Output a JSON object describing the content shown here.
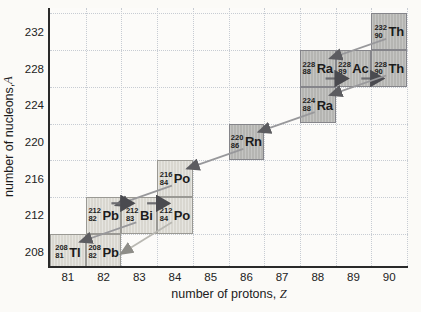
{
  "axes": {
    "x": {
      "title": "number of protons, ",
      "variable": "Z"
    },
    "y": {
      "title": "number of nucleons, ",
      "variable": "A"
    }
  },
  "colors": {
    "box_dark": "#b5b5b2",
    "box_dark_border": "#85858a",
    "box_light": "#d9d7d0",
    "box_light_border": "#9a9994",
    "alpha_line": "#98989b",
    "alpha_head": "#5c5c60",
    "beta_line": "#6d6d71",
    "beta_head": "#4a4a4f",
    "light_line": "#b9b8b2",
    "light_head": "#8e8d88",
    "axis": "#2a2a2a",
    "grid": "#c7ccd3",
    "text": "#1c1c1c"
  },
  "chart_data": {
    "type": "scatter",
    "title": "",
    "xlabel": "number of protons, Z",
    "ylabel": "number of nucleons, A",
    "xlim": [
      80.5,
      90.5
    ],
    "ylim": [
      206,
      234
    ],
    "x_ticks": [
      81,
      82,
      83,
      84,
      85,
      86,
      87,
      88,
      89,
      90
    ],
    "y_ticks": [
      232,
      228,
      224,
      220,
      216,
      212,
      208
    ],
    "grid": true,
    "nuclides": [
      {
        "id": "th232",
        "symbol": "Th",
        "mass": 232,
        "protons": 90,
        "shade": "dark"
      },
      {
        "id": "ra228",
        "symbol": "Ra",
        "mass": 228,
        "protons": 88,
        "shade": "dark"
      },
      {
        "id": "ac228",
        "symbol": "Ac",
        "mass": 228,
        "protons": 89,
        "shade": "dark"
      },
      {
        "id": "th228",
        "symbol": "Th",
        "mass": 228,
        "protons": 90,
        "shade": "dark"
      },
      {
        "id": "ra224",
        "symbol": "Ra",
        "mass": 224,
        "protons": 88,
        "shade": "dark"
      },
      {
        "id": "rn220",
        "symbol": "Rn",
        "mass": 220,
        "protons": 86,
        "shade": "dark"
      },
      {
        "id": "po216",
        "symbol": "Po",
        "mass": 216,
        "protons": 84,
        "shade": "light"
      },
      {
        "id": "pb212",
        "symbol": "Pb",
        "mass": 212,
        "protons": 82,
        "shade": "light"
      },
      {
        "id": "bi212",
        "symbol": "Bi",
        "mass": 212,
        "protons": 83,
        "shade": "light"
      },
      {
        "id": "po212",
        "symbol": "Po",
        "mass": 212,
        "protons": 84,
        "shade": "light"
      },
      {
        "id": "tl208",
        "symbol": "Tl",
        "mass": 208,
        "protons": 81,
        "shade": "light"
      },
      {
        "id": "pb208",
        "symbol": "Pb",
        "mass": 208,
        "protons": 82,
        "shade": "light"
      }
    ],
    "decays": [
      {
        "from": "th232",
        "to": "ra228",
        "type": "alpha"
      },
      {
        "from": "ra228",
        "to": "ac228",
        "type": "beta"
      },
      {
        "from": "ac228",
        "to": "th228",
        "type": "beta"
      },
      {
        "from": "th228",
        "to": "ra224",
        "type": "alpha"
      },
      {
        "from": "ra224",
        "to": "rn220",
        "type": "alpha"
      },
      {
        "from": "rn220",
        "to": "po216",
        "type": "alpha"
      },
      {
        "from": "po216",
        "to": "pb212",
        "type": "alpha"
      },
      {
        "from": "pb212",
        "to": "bi212",
        "type": "beta"
      },
      {
        "from": "bi212",
        "to": "po212",
        "type": "beta"
      },
      {
        "from": "bi212",
        "to": "tl208",
        "type": "alpha"
      },
      {
        "from": "po212",
        "to": "pb208",
        "type": "alpha",
        "variant": "light"
      }
    ]
  }
}
